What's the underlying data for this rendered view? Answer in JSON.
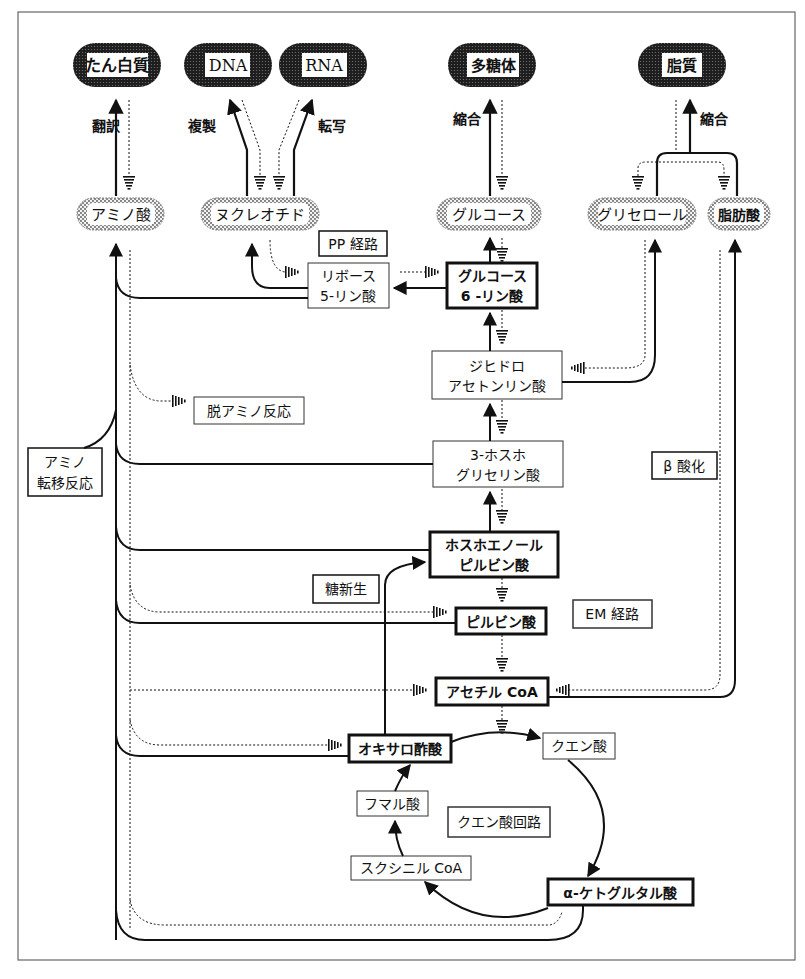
{
  "colors": {
    "ink": "#111111",
    "frame": "#555555",
    "dark_fill": "#2a2a2a",
    "stipple": "#bdbdbd",
    "background": "#ffffff"
  },
  "macromolecules": [
    {
      "id": "protein",
      "label": "たん白質"
    },
    {
      "id": "dna",
      "label": "DNA"
    },
    {
      "id": "rna",
      "label": "RNA"
    },
    {
      "id": "polysaccharide",
      "label": "多糖体"
    },
    {
      "id": "lipid",
      "label": "脂質"
    }
  ],
  "monomers": [
    {
      "id": "amino_acid",
      "label": "アミノ酸"
    },
    {
      "id": "nucleotide",
      "label": "ヌクレオチド"
    },
    {
      "id": "glucose",
      "label": "グルコース"
    },
    {
      "id": "glycerol",
      "label": "グリセロール"
    },
    {
      "id": "fatty_acid",
      "label": "脂肪酸"
    }
  ],
  "reaction_labels": {
    "translation": "翻訳",
    "replication": "複製",
    "transcription": "転写",
    "condensation_sugar": "縮合",
    "condensation_lipid": "縮合"
  },
  "pathway_labels": {
    "pp": "PP 経路",
    "deamination": "脱アミノ反応",
    "transamination_1": "アミノ",
    "transamination_2": "転移反応",
    "beta_oxidation": "β 酸化",
    "gluconeogenesis": "糖新生",
    "em": "EM 経路",
    "tca": "クエン酸回路"
  },
  "intermediates": {
    "ribose5p_1": "リボース",
    "ribose5p_2": "5-リン酸",
    "g6p_1": "グルコース",
    "g6p_2": "6 -リン酸",
    "dhap_1": "ジヒドロ",
    "dhap_2": "アセトンリン酸",
    "pga_1": "3-ホスホ",
    "pga_2": "グリセリン酸",
    "pep_1": "ホスホエノール",
    "pep_2": "ピルビン酸",
    "pyruvate": "ピルビン酸",
    "acetyl_coa": "アセチル CoA",
    "oxaloacetate": "オキサロ酢酸",
    "citrate": "クエン酸",
    "fumarate": "フマル酸",
    "succinyl_coa": "スクシニル CoA",
    "alpha_kg": "α-ケトグルタル酸"
  }
}
